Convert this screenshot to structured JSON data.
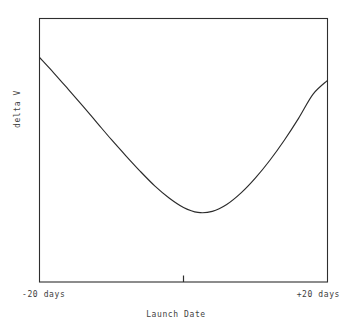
{
  "chart_data": {
    "type": "line",
    "title": "",
    "xlabel": "Launch Date",
    "ylabel": "delta V",
    "xlim": [
      -20,
      20
    ],
    "ylim": [
      0,
      1
    ],
    "xticklabels": [
      "-20 days",
      "+20 days"
    ],
    "xtick_left_label": "-20 days",
    "xtick_right_label": "+20 days",
    "center_tick": true,
    "grid": false,
    "legend": false,
    "axis_numeric_ticks": false,
    "frame": "box",
    "line_color": "#2b2b2b",
    "background_color": "#ffffff",
    "series": [
      {
        "name": "delta V",
        "x": [
          -20,
          -18,
          -16,
          -14,
          -12,
          -10,
          -8,
          -6,
          -4,
          -2,
          0,
          2,
          4,
          6,
          8,
          10,
          12,
          14,
          16,
          18,
          20
        ],
        "y": [
          0.852,
          0.793,
          0.731,
          0.668,
          0.604,
          0.54,
          0.479,
          0.42,
          0.365,
          0.319,
          0.283,
          0.264,
          0.268,
          0.294,
          0.338,
          0.395,
          0.462,
          0.538,
          0.622,
          0.713,
          0.765
        ]
      }
    ],
    "annotations": []
  },
  "axes": {
    "ylabel": "delta V",
    "xlabel": "Launch Date",
    "left_tick_label": "-20 days",
    "right_tick_label": "+20 days"
  }
}
